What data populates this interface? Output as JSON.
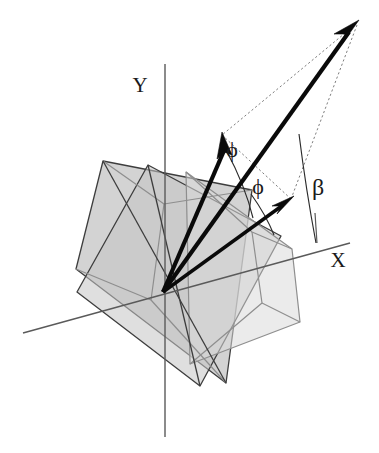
{
  "figure": {
    "type": "vector-geometry-diagram",
    "background_color": "#ffffff"
  },
  "axes": {
    "x": {
      "label": "X",
      "label_position": {
        "x": 338,
        "y": 267
      },
      "line": {
        "x1": 23,
        "y1": 333,
        "x2": 350,
        "y2": 243
      },
      "color": "#5a5a5a"
    },
    "y": {
      "label": "Y",
      "label_position": {
        "x": 140,
        "y": 92
      },
      "line": {
        "x1": 165,
        "y1": 64,
        "x2": 165,
        "y2": 437
      },
      "color": "#5a5a5a"
    },
    "origin": {
      "x": 163,
      "y": 292
    }
  },
  "vectors": [
    {
      "name": "vector-1",
      "tip": {
        "x": 223,
        "y": 133
      },
      "width": 4.2,
      "color": "#0a0a0a"
    },
    {
      "name": "vector-2",
      "tip": {
        "x": 358,
        "y": 22
      },
      "width": 4.4,
      "color": "#0a0a0a"
    },
    {
      "name": "vector-3",
      "tip": {
        "x": 292,
        "y": 198
      },
      "width": 3.6,
      "color": "#0a0a0a"
    }
  ],
  "angles": [
    {
      "name": "phi-upper",
      "symbol": "ϕ",
      "label_position": {
        "x": 232,
        "y": 157
      },
      "font_size": 22
    },
    {
      "name": "phi-lower",
      "symbol": "ϕ",
      "label_position": {
        "x": 258,
        "y": 194
      },
      "font_size": 22
    },
    {
      "name": "beta",
      "symbol": "β",
      "label_position": {
        "x": 318,
        "y": 195
      },
      "font_size": 24
    }
  ],
  "planes": [
    {
      "name": "plane-back-left",
      "fill": "#b8b8b8",
      "stroke": "#3d3d3d",
      "points": "103,161 252,190 226,383 76,269"
    },
    {
      "name": "plane-mid",
      "fill": "#c4c4c4",
      "stroke": "#3d3d3d",
      "points": "148,165 281,236 200,386 77,292"
    },
    {
      "name": "plane-front-right",
      "fill": "#dadada",
      "stroke": "#8e8e8e",
      "points": "186,172 292,249 300,322 190,364"
    }
  ],
  "guides": {
    "dotted_lines": [
      {
        "name": "guide-tip-to-vector1",
        "from": {
          "x": 358,
          "y": 22
        },
        "to": {
          "x": 223,
          "y": 133
        }
      },
      {
        "name": "guide-tip-to-vector3",
        "from": {
          "x": 358,
          "y": 22
        },
        "to": {
          "x": 292,
          "y": 198
        }
      },
      {
        "name": "guide-cone-ridge",
        "from": {
          "x": 223,
          "y": 133
        },
        "to": {
          "x": 292,
          "y": 198
        }
      }
    ]
  },
  "stroke_colors": {
    "axis": "#5a5a5a",
    "vector": "#0a0a0a",
    "plane_edge_dark": "#3d3d3d",
    "plane_edge_light": "#8e8e8e",
    "dotted_guide": "#6f6f6f",
    "arc": "#2b2b2b"
  }
}
